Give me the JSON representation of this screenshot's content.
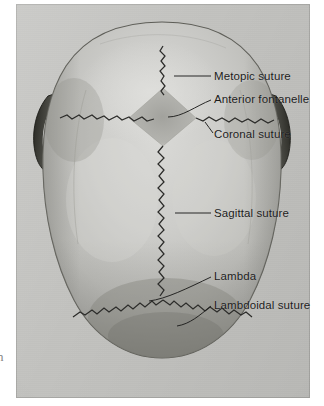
{
  "figure": {
    "view": "superior (from above), anterior at top",
    "medium": "scanned halftone anatomical photograph/illustration",
    "edge_glyph": "n"
  },
  "palette": {
    "paper_white": "#ffffff",
    "plate_background": "#c2c2bf",
    "skull_light": "#cdcdca",
    "skull_midtone": "#b4b4b0",
    "skull_shadow": "#8a8a86",
    "ear_dark": "#3a3a37",
    "suture_line": "#2c2c2a",
    "fontanelle_fill": "#a9a9a5",
    "label_text": "#1b1b1b",
    "leader_line": "#1f1f1e"
  },
  "labels": [
    {
      "id": "metopic-suture",
      "text": "Metopic suture",
      "leader": {
        "type": "straight",
        "from": [
          173,
          76
        ],
        "to": [
          210,
          76
        ]
      },
      "anchor_region": "anterior midline, frontal bone"
    },
    {
      "id": "anterior-fontanelle",
      "text": "Anterior fontanelle",
      "leader": {
        "type": "curved",
        "from": [
          168,
          116
        ],
        "to": [
          210,
          99
        ]
      },
      "anchor_region": "diamond-shaped membranous gap at bregma"
    },
    {
      "id": "coronal-suture",
      "text": "Coronal suture",
      "leader": {
        "type": "curved",
        "from": [
          204,
          121
        ],
        "to": [
          212,
          131
        ]
      },
      "anchor_region": "transverse suture between frontal and parietal bones"
    },
    {
      "id": "sagittal-suture",
      "text": "Sagittal suture",
      "leader": {
        "type": "straight",
        "from": [
          174,
          213
        ],
        "to": [
          210,
          213
        ]
      },
      "anchor_region": "midline suture between the two parietal bones"
    },
    {
      "id": "lambda",
      "text": "Lambda",
      "leader": {
        "type": "curved",
        "from": [
          148,
          300
        ],
        "to": [
          210,
          276
        ]
      },
      "anchor_region": "junction of sagittal and lambdoidal sutures"
    },
    {
      "id": "lambdoidal-suture",
      "text": "Lambdoidal suture",
      "leader": {
        "type": "curved",
        "from": [
          176,
          325
        ],
        "to": [
          210,
          305
        ]
      },
      "anchor_region": "chevron suture between parietal and occipital bones"
    }
  ],
  "anatomy": {
    "skull_outline": "broad ovoid cranial vault, widest across the parietal eminences",
    "ears": [
      {
        "side": "left",
        "position": [
          52,
          128
        ]
      },
      {
        "side": "right",
        "position": [
          272,
          128
        ]
      }
    ],
    "sutures": [
      "metopic (frontal midline, superior)",
      "coronal (transverse, anterior third)",
      "sagittal (midline, long axis)",
      "lambdoidal (posterior chevron)"
    ],
    "fontanelles": [
      "anterior fontanelle (bregma, diamond-shaped)"
    ]
  }
}
